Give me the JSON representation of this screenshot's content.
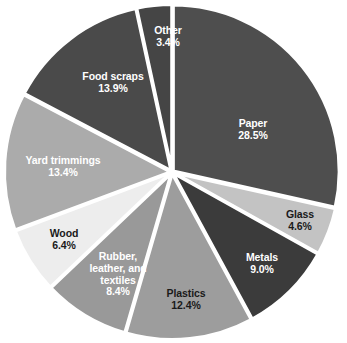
{
  "chart_data": {
    "type": "pie",
    "title": "",
    "subtitle": "",
    "xlabel": "",
    "ylabel": "",
    "legend": "none",
    "grid": false,
    "units": "percent",
    "total": 99.999,
    "start_angle_deg": 0,
    "direction": "clockwise",
    "categories": [
      "Paper",
      "Glass",
      "Metals",
      "Plastics",
      "Rubber, leather, and textiles",
      "Wood",
      "Yard trimmings",
      "Food scraps",
      "Other"
    ],
    "values": [
      28.5,
      4.6,
      9.0,
      12.4,
      8.4,
      6.4,
      13.4,
      13.9,
      3.4
    ],
    "slices": [
      {
        "name": "Paper",
        "label_lines": [
          "Paper"
        ],
        "value": 28.5,
        "value_label": "28.5%",
        "color": "#4e4e4e",
        "text_color": "#ffffff",
        "label_x": 253,
        "label_y": 130
      },
      {
        "name": "Glass",
        "label_lines": [
          "Glass"
        ],
        "value": 4.6,
        "value_label": "4.6%",
        "color": "#c3c3c3",
        "text_color": "#1a1a1a",
        "label_x": 300,
        "label_y": 221
      },
      {
        "name": "Metals",
        "label_lines": [
          "Metals"
        ],
        "value": 9.0,
        "value_label": "9.0%",
        "color": "#3b3b3b",
        "text_color": "#ffffff",
        "label_x": 262,
        "label_y": 264
      },
      {
        "name": "Plastics",
        "label_lines": [
          "Plastics"
        ],
        "value": 12.4,
        "value_label": "12.4%",
        "color": "#9d9d9d",
        "text_color": "#1a1a1a",
        "label_x": 186,
        "label_y": 300
      },
      {
        "name": "Rubber, leather, and textiles",
        "label_lines": [
          "Rubber,",
          "leather, and",
          "textiles"
        ],
        "value": 8.4,
        "value_label": "8.4%",
        "color": "#999999",
        "text_color": "#ffffff",
        "label_x": 118,
        "label_y": 274
      },
      {
        "name": "Wood",
        "label_lines": [
          "Wood"
        ],
        "value": 6.4,
        "value_label": "6.4%",
        "color": "#ededed",
        "text_color": "#1a1a1a",
        "label_x": 64,
        "label_y": 240
      },
      {
        "name": "Yard trimmings",
        "label_lines": [
          "Yard trimmings"
        ],
        "value": 13.4,
        "value_label": "13.4%",
        "color": "#ababab",
        "text_color": "#ffffff",
        "label_x": 63,
        "label_y": 167
      },
      {
        "name": "Food scraps",
        "label_lines": [
          "Food scraps"
        ],
        "value": 13.9,
        "value_label": "13.9%",
        "color": "#4a4a4a",
        "text_color": "#ffffff",
        "label_x": 113,
        "label_y": 83
      },
      {
        "name": "Other",
        "label_lines": [
          "Other"
        ],
        "value": 3.4,
        "value_label": "3.4%",
        "color": "#454545",
        "text_color": "#ffffff",
        "label_x": 168,
        "label_y": 37
      }
    ],
    "geometry": {
      "center_x": 172,
      "center_y": 172,
      "radius": 166,
      "separator_color": "#ffffff",
      "separator_width": 3.2,
      "explode": 1.6
    },
    "background_color": "#ffffff"
  }
}
